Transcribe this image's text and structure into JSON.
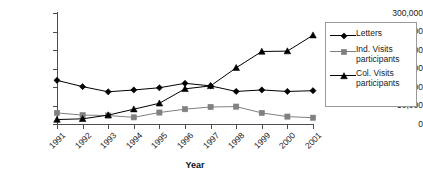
{
  "chart_data": {
    "type": "line",
    "title": "",
    "xlabel": "Year",
    "ylabel": "",
    "categories": [
      "1991",
      "1992",
      "1993",
      "1994",
      "1995",
      "1996",
      "1997",
      "1998",
      "1999",
      "2000",
      "2001"
    ],
    "ylim": [
      0,
      300000
    ],
    "ytick_labels": [
      "0",
      "50,000",
      "100,000",
      "150,000",
      "200,000",
      "250,000",
      "300,000"
    ],
    "ytick_values": [
      0,
      50000,
      100000,
      150000,
      200000,
      250000,
      300000
    ],
    "grid": false,
    "legend_position": "right",
    "series": [
      {
        "name": "Letters",
        "marker": "diamond",
        "color": "#000000",
        "values": [
          118000,
          101000,
          87000,
          92000,
          98000,
          110000,
          103000,
          88000,
          92000,
          88000,
          90000
        ]
      },
      {
        "name": "Ind. Visits participants",
        "marker": "square",
        "color": "#808080",
        "values": [
          30000,
          24000,
          23000,
          18000,
          31000,
          40000,
          46000,
          47000,
          30000,
          20000,
          17000
        ]
      },
      {
        "name": "Col. Visits participants",
        "marker": "triangle",
        "color": "#000000",
        "values": [
          12000,
          14000,
          24000,
          40000,
          56000,
          95000,
          103000,
          152000,
          196000,
          197000,
          240000
        ]
      }
    ]
  },
  "legend": {
    "entries": [
      {
        "label": "Letters"
      },
      {
        "label": "Ind. Visits participants"
      },
      {
        "label": "Col. Visits participants"
      }
    ]
  },
  "axis": {
    "x_title": "Year"
  }
}
